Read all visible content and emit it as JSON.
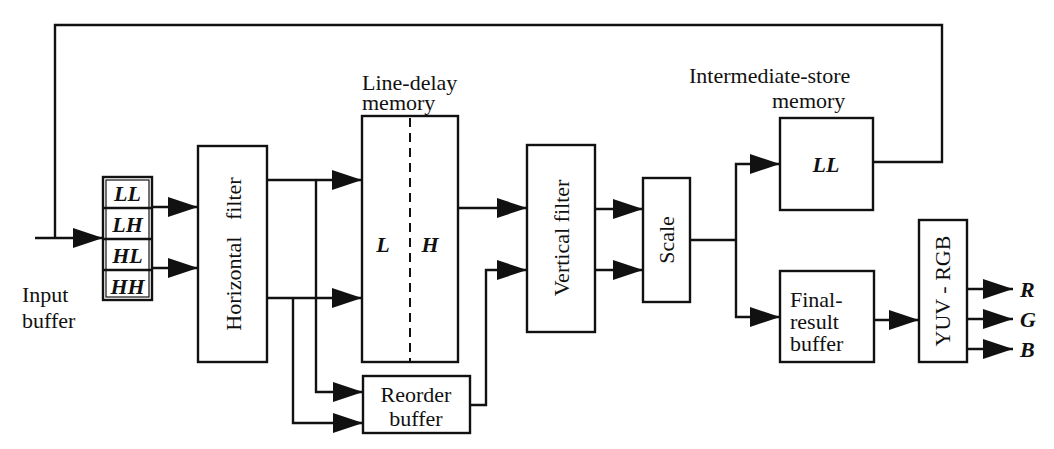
{
  "diagram": {
    "type": "block-diagram",
    "input": {
      "label_line1": "Input",
      "label_line2": "buffer"
    },
    "input_buffer_cells": [
      "LL",
      "LH",
      "HL",
      "HH"
    ],
    "blocks": {
      "horizontal_filter": "Horizontal   filter",
      "line_delay_title_1": "Line-delay",
      "line_delay_title_2": "memory",
      "line_delay_left": "L",
      "line_delay_right": "H",
      "reorder_1": "Reorder",
      "reorder_2": "buffer",
      "vertical_filter": "Vertical filter",
      "scale": "Scale",
      "intermediate_title_1": "Intermediate-store",
      "intermediate_title_2": "memory",
      "intermediate_content": "LL",
      "final_1": "Final-",
      "final_2": "result",
      "final_3": "buffer",
      "yuv_rgb": "YUV - RGB"
    },
    "outputs": [
      "R",
      "G",
      "B"
    ],
    "edges": [
      [
        "input",
        "input_buffer"
      ],
      [
        "input_buffer.LL",
        "horizontal_filter"
      ],
      [
        "input_buffer.HL",
        "horizontal_filter"
      ],
      [
        "horizontal_filter",
        "line_delay_memory"
      ],
      [
        "horizontal_filter",
        "line_delay_memory"
      ],
      [
        "horizontal_filter",
        "reorder_buffer"
      ],
      [
        "horizontal_filter",
        "reorder_buffer"
      ],
      [
        "line_delay_memory",
        "vertical_filter"
      ],
      [
        "reorder_buffer",
        "vertical_filter"
      ],
      [
        "vertical_filter",
        "scale"
      ],
      [
        "vertical_filter",
        "scale"
      ],
      [
        "scale",
        "intermediate_store_memory"
      ],
      [
        "scale",
        "final_result_buffer"
      ],
      [
        "intermediate_store_memory",
        "input (feedback)"
      ],
      [
        "final_result_buffer",
        "yuv_rgb"
      ],
      [
        "yuv_rgb",
        "R"
      ],
      [
        "yuv_rgb",
        "G"
      ],
      [
        "yuv_rgb",
        "B"
      ]
    ]
  }
}
